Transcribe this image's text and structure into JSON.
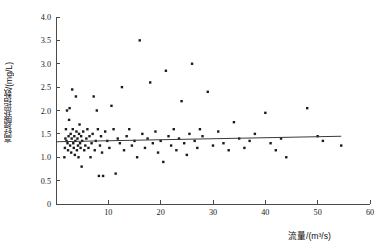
{
  "chart_data": {
    "type": "scatter",
    "title": "",
    "xlabel": "流量/(m³/s)",
    "ylabel": "高锰酸盐指数/(mg/L)",
    "xlim": [
      0,
      60
    ],
    "ylim": [
      0,
      4.0
    ],
    "xticks": [
      0,
      10,
      20,
      30,
      40,
      50,
      60
    ],
    "xtick_labels": [
      "0",
      "10",
      "20",
      "30",
      "40",
      "50",
      "60"
    ],
    "yticks": [
      0,
      0.5,
      1.0,
      1.5,
      2.0,
      2.5,
      3.0,
      3.5,
      4.0
    ],
    "ytick_labels": [
      "0",
      "0.5",
      "1.0",
      "1.5",
      "2.0",
      "2.5",
      "3.0",
      "3.5",
      "4.0"
    ],
    "grid": false,
    "legend": null,
    "marker": "square",
    "marker_color": "#1a1a1a",
    "series": [
      {
        "name": "高锰酸盐指数",
        "points": [
          [
            1.6,
            1.0
          ],
          [
            1.7,
            1.2
          ],
          [
            1.8,
            1.4
          ],
          [
            1.9,
            1.6
          ],
          [
            2.0,
            1.35
          ],
          [
            2.1,
            2.0
          ],
          [
            2.2,
            1.3
          ],
          [
            2.3,
            1.15
          ],
          [
            2.4,
            1.45
          ],
          [
            2.5,
            1.8
          ],
          [
            2.6,
            2.05
          ],
          [
            2.7,
            1.25
          ],
          [
            2.8,
            1.5
          ],
          [
            2.9,
            1.1
          ],
          [
            3.0,
            1.4
          ],
          [
            3.1,
            2.45
          ],
          [
            3.2,
            1.6
          ],
          [
            3.3,
            1.3
          ],
          [
            3.4,
            1.2
          ],
          [
            3.5,
            1.45
          ],
          [
            3.6,
            1.05
          ],
          [
            3.7,
            1.35
          ],
          [
            3.8,
            2.3
          ],
          [
            3.9,
            1.55
          ],
          [
            4.0,
            1.15
          ],
          [
            4.1,
            1.4
          ],
          [
            4.2,
            1.25
          ],
          [
            4.3,
            1.0
          ],
          [
            4.4,
            1.5
          ],
          [
            4.5,
            1.7
          ],
          [
            4.6,
            1.3
          ],
          [
            4.7,
            1.2
          ],
          [
            4.8,
            1.45
          ],
          [
            4.9,
            0.8
          ],
          [
            5.0,
            1.35
          ],
          [
            5.2,
            1.55
          ],
          [
            5.4,
            1.15
          ],
          [
            5.6,
            1.25
          ],
          [
            5.8,
            1.4
          ],
          [
            6.0,
            1.6
          ],
          [
            6.2,
            1.2
          ],
          [
            6.4,
            1.45
          ],
          [
            6.6,
            1.0
          ],
          [
            6.8,
            1.3
          ],
          [
            7.0,
            1.5
          ],
          [
            7.2,
            2.3
          ],
          [
            7.4,
            1.15
          ],
          [
            7.6,
            1.35
          ],
          [
            7.8,
            2.0
          ],
          [
            8.0,
            1.6
          ],
          [
            8.2,
            0.6
          ],
          [
            8.4,
            1.25
          ],
          [
            8.6,
            1.45
          ],
          [
            8.8,
            1.1
          ],
          [
            9.0,
            0.6
          ],
          [
            9.4,
            1.55
          ],
          [
            9.8,
            1.35
          ],
          [
            10.2,
            1.2
          ],
          [
            10.6,
            2.1
          ],
          [
            11.0,
            1.6
          ],
          [
            11.4,
            0.65
          ],
          [
            11.8,
            1.4
          ],
          [
            12.2,
            1.3
          ],
          [
            12.6,
            2.5
          ],
          [
            13.0,
            1.15
          ],
          [
            13.5,
            1.45
          ],
          [
            14.0,
            1.6
          ],
          [
            14.5,
            1.25
          ],
          [
            15.0,
            1.35
          ],
          [
            15.5,
            1.0
          ],
          [
            16.0,
            3.5
          ],
          [
            16.5,
            1.5
          ],
          [
            17.0,
            1.2
          ],
          [
            17.5,
            1.4
          ],
          [
            18.0,
            2.6
          ],
          [
            18.5,
            1.3
          ],
          [
            19.0,
            1.55
          ],
          [
            19.5,
            1.1
          ],
          [
            20.0,
            1.35
          ],
          [
            20.5,
            0.9
          ],
          [
            21.0,
            2.85
          ],
          [
            21.5,
            1.45
          ],
          [
            22.0,
            1.25
          ],
          [
            22.5,
            1.6
          ],
          [
            23.0,
            1.15
          ],
          [
            23.5,
            1.4
          ],
          [
            24.0,
            2.2
          ],
          [
            24.5,
            1.3
          ],
          [
            25.0,
            1.05
          ],
          [
            25.5,
            1.5
          ],
          [
            26.0,
            3.0
          ],
          [
            26.5,
            1.35
          ],
          [
            27.0,
            1.2
          ],
          [
            27.5,
            1.6
          ],
          [
            28.0,
            1.45
          ],
          [
            29.0,
            2.4
          ],
          [
            30.0,
            1.25
          ],
          [
            31.0,
            1.55
          ],
          [
            32.0,
            1.3
          ],
          [
            33.0,
            1.15
          ],
          [
            34.0,
            1.75
          ],
          [
            35.0,
            1.4
          ],
          [
            36.0,
            1.2
          ],
          [
            37.0,
            1.35
          ],
          [
            38.0,
            1.5
          ],
          [
            40.0,
            1.95
          ],
          [
            41.0,
            1.3
          ],
          [
            42.0,
            1.15
          ],
          [
            43.0,
            1.4
          ],
          [
            44.0,
            1.0
          ],
          [
            48.0,
            2.05
          ],
          [
            50.0,
            1.45
          ],
          [
            51.0,
            1.35
          ],
          [
            54.5,
            1.25
          ]
        ]
      }
    ],
    "trendline": {
      "name": "linear fit",
      "x_start": 0.0,
      "y_start": 1.33,
      "x_end": 54.5,
      "y_end": 1.45
    }
  }
}
